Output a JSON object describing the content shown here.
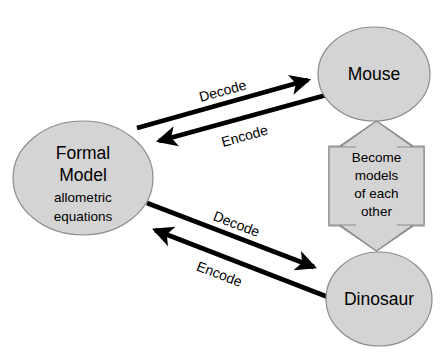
{
  "diagram": {
    "background_color": "#ffffff",
    "node_fill_color": "#d4d4d4",
    "node_stroke_color": "#8c8c8c",
    "connector_color": "#000000",
    "nodes": [
      {
        "id": "formal-model",
        "shape": "ellipse",
        "label_line1": "Formal",
        "label_line2": "Model",
        "sub_line1": "allometric",
        "sub_line2": "equations",
        "cx": 83,
        "cy": 178,
        "rx": 70,
        "ry": 57
      },
      {
        "id": "mouse",
        "shape": "ellipse",
        "label_line1": "Mouse",
        "cx": 374,
        "cy": 74,
        "rx": 56,
        "ry": 47
      },
      {
        "id": "dinosaur",
        "shape": "ellipse",
        "label_line1": "Dinosaur",
        "cx": 379,
        "cy": 299,
        "rx": 53,
        "ry": 47
      }
    ],
    "block_arrow": {
      "id": "become-models",
      "shape": "double-headed-vertical-block-arrow",
      "text_lines": [
        "Become",
        "models",
        "of each",
        "other"
      ],
      "box_left": 329,
      "box_right": 424,
      "box_top": 146,
      "box_bottom": 226,
      "tip_top": 121,
      "tip_bottom": 251,
      "head_left": 340,
      "head_right": 413,
      "shaft_left": 356,
      "shaft_right": 397
    },
    "connectors": [
      {
        "id": "decode-upper",
        "label": "Decode",
        "from": "formal-model",
        "to": "mouse",
        "x1": 137,
        "y1": 128,
        "x2": 314,
        "y2": 79,
        "label_x": 223,
        "label_y": 92,
        "label_angle": -15.5,
        "arrow_at": "end"
      },
      {
        "id": "encode-upper",
        "label": "Encode",
        "from": "mouse",
        "to": "formal-model",
        "x1": 330,
        "y1": 94,
        "x2": 152,
        "y2": 143,
        "label_x": 245,
        "label_y": 137,
        "label_angle": -15.5,
        "arrow_at": "end"
      },
      {
        "id": "decode-lower",
        "label": "Decode",
        "from": "formal-model",
        "to": "dinosaur",
        "x1": 147,
        "y1": 203,
        "x2": 321,
        "y2": 270,
        "label_x": 236,
        "label_y": 225,
        "label_angle": 21,
        "arrow_at": "end"
      },
      {
        "id": "encode-lower",
        "label": "Encode",
        "from": "dinosaur",
        "to": "formal-model",
        "x1": 333,
        "y1": 299,
        "x2": 148,
        "y2": 227,
        "label_x": 219,
        "label_y": 275,
        "label_angle": 21,
        "arrow_at": "end"
      }
    ]
  }
}
